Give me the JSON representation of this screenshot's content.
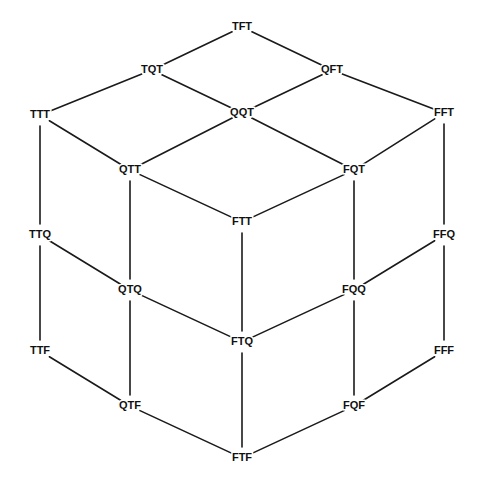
{
  "figure": {
    "kind": "hasse-diagram",
    "title": "",
    "background_color": "#ffffff",
    "line_color": "#1a1a1a",
    "text_color": "#111111"
  },
  "chart_data": {
    "type": "diagram",
    "title": "",
    "xlabel": "",
    "ylabel": "",
    "layout": "isometric-cube-lattice",
    "node_count": 20,
    "edge_count": 30,
    "nodes": [
      {
        "id": "TFT",
        "label": "TFT",
        "x": 242,
        "y": 27
      },
      {
        "id": "TQT",
        "label": "TQT",
        "x": 152,
        "y": 70
      },
      {
        "id": "QFT",
        "label": "QFT",
        "x": 332,
        "y": 70
      },
      {
        "id": "TTT",
        "label": "TTT",
        "x": 40,
        "y": 115
      },
      {
        "id": "QQT",
        "label": "QQT",
        "x": 242,
        "y": 113
      },
      {
        "id": "FFT",
        "label": "FFT",
        "x": 444,
        "y": 113
      },
      {
        "id": "QTT",
        "label": "QTT",
        "x": 130,
        "y": 170
      },
      {
        "id": "FQT",
        "label": "FQT",
        "x": 354,
        "y": 170
      },
      {
        "id": "FTT",
        "label": "FTT",
        "x": 242,
        "y": 222
      },
      {
        "id": "TTQ",
        "label": "TTQ",
        "x": 40,
        "y": 235
      },
      {
        "id": "FFQ",
        "label": "FFQ",
        "x": 444,
        "y": 235
      },
      {
        "id": "QTQ",
        "label": "QTQ",
        "x": 130,
        "y": 290
      },
      {
        "id": "FQQ",
        "label": "FQQ",
        "x": 354,
        "y": 290
      },
      {
        "id": "FTQ",
        "label": "FTQ",
        "x": 242,
        "y": 342
      },
      {
        "id": "TTF",
        "label": "TTF",
        "x": 40,
        "y": 351
      },
      {
        "id": "FFF",
        "label": "FFF",
        "x": 444,
        "y": 351
      },
      {
        "id": "QTF",
        "label": "QTF",
        "x": 130,
        "y": 406
      },
      {
        "id": "FQF",
        "label": "FQF",
        "x": 354,
        "y": 406
      },
      {
        "id": "FTF",
        "label": "FTF",
        "x": 242,
        "y": 458
      }
    ],
    "edges": [
      {
        "from": "TFT",
        "to": "TQT"
      },
      {
        "from": "TFT",
        "to": "QFT"
      },
      {
        "from": "TQT",
        "to": "TTT"
      },
      {
        "from": "TQT",
        "to": "QQT"
      },
      {
        "from": "QFT",
        "to": "QQT"
      },
      {
        "from": "QFT",
        "to": "FFT"
      },
      {
        "from": "TTT",
        "to": "QTT"
      },
      {
        "from": "QQT",
        "to": "QTT"
      },
      {
        "from": "QQT",
        "to": "FQT"
      },
      {
        "from": "FFT",
        "to": "FQT"
      },
      {
        "from": "QTT",
        "to": "FTT"
      },
      {
        "from": "FQT",
        "to": "FTT"
      },
      {
        "from": "TTT",
        "to": "TTQ"
      },
      {
        "from": "QTT",
        "to": "QTQ"
      },
      {
        "from": "FTT",
        "to": "FTQ"
      },
      {
        "from": "FQT",
        "to": "FQQ"
      },
      {
        "from": "FFT",
        "to": "FFQ"
      },
      {
        "from": "TTQ",
        "to": "QTQ"
      },
      {
        "from": "QTQ",
        "to": "FTQ"
      },
      {
        "from": "FTQ",
        "to": "FQQ"
      },
      {
        "from": "FQQ",
        "to": "FFQ"
      },
      {
        "from": "TTQ",
        "to": "TTF"
      },
      {
        "from": "QTQ",
        "to": "QTF"
      },
      {
        "from": "FTQ",
        "to": "FTF"
      },
      {
        "from": "FQQ",
        "to": "FQF"
      },
      {
        "from": "FFQ",
        "to": "FFF"
      },
      {
        "from": "TTF",
        "to": "QTF"
      },
      {
        "from": "QTF",
        "to": "FTF"
      },
      {
        "from": "FTF",
        "to": "FQF"
      },
      {
        "from": "FQF",
        "to": "FFF"
      }
    ]
  }
}
